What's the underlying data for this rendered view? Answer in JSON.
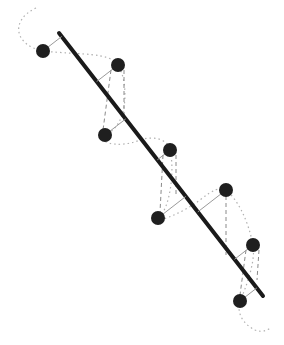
{
  "diagram": {
    "type": "regression-residuals",
    "background": "#ffffff",
    "colors": {
      "line": "#1a1a1a",
      "point": "#1f1f1f",
      "residual": "#9a9a9a",
      "dashed": "#8a8a8a",
      "dotted": "#b0b0b0"
    },
    "regression_line": {
      "x1": 59,
      "y1": 33,
      "x2": 263,
      "y2": 296
    },
    "points": [
      {
        "x": 43,
        "y": 51
      },
      {
        "x": 118,
        "y": 65
      },
      {
        "x": 105,
        "y": 135
      },
      {
        "x": 170,
        "y": 150
      },
      {
        "x": 158,
        "y": 218
      },
      {
        "x": 226,
        "y": 190
      },
      {
        "x": 253,
        "y": 245
      },
      {
        "x": 240,
        "y": 301
      }
    ]
  }
}
